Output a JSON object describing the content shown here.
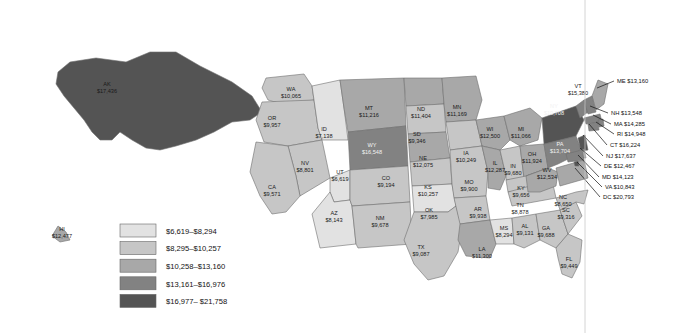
{
  "chart_data": {
    "type": "map",
    "title": "",
    "map_kind": "choropleth",
    "region": "United States",
    "value_prefix": "$",
    "legend": {
      "position": "bottom-left",
      "classes": [
        {
          "label": "$6,619–$8,294",
          "color": "#e2e2e2",
          "min": 6619,
          "max": 8294
        },
        {
          "label": "$8,295–$10,257",
          "color": "#c6c6c6",
          "min": 8295,
          "max": 10257
        },
        {
          "label": "$10,258–$13,160",
          "color": "#a8a8a8",
          "min": 10258,
          "max": 13160
        },
        {
          "label": "$13,161–$16,976",
          "color": "#828282",
          "min": 13161,
          "max": 16976
        },
        {
          "label": "$16,977– $21,758",
          "color": "#545454",
          "min": 16977,
          "max": 21758
        }
      ]
    },
    "states": [
      {
        "code": "AK",
        "value": "$17,436",
        "num": 17436,
        "class": 5,
        "label_mode": "inline"
      },
      {
        "code": "HI",
        "value": "$12,477",
        "num": 12477,
        "class": 3,
        "label_mode": "inline"
      },
      {
        "code": "WA",
        "value": "$10,065",
        "num": 10065,
        "class": 2,
        "label_mode": "inline"
      },
      {
        "code": "OR",
        "value": "$9,957",
        "num": 9957,
        "class": 2,
        "label_mode": "inline"
      },
      {
        "code": "ID",
        "value": "$7,138",
        "num": 7138,
        "class": 1,
        "label_mode": "inline"
      },
      {
        "code": "MT",
        "value": "$11,216",
        "num": 11216,
        "class": 3,
        "label_mode": "inline"
      },
      {
        "code": "WY",
        "value": "$16,548",
        "num": 16548,
        "class": 4,
        "label_mode": "inline"
      },
      {
        "code": "NV",
        "value": "$8,801",
        "num": 8801,
        "class": 2,
        "label_mode": "inline"
      },
      {
        "code": "UT",
        "value": "$6,619",
        "num": 6619,
        "class": 1,
        "label_mode": "inline"
      },
      {
        "code": "CA",
        "value": "$9,571",
        "num": 9571,
        "class": 2,
        "label_mode": "inline"
      },
      {
        "code": "AZ",
        "value": "$8,143",
        "num": 8143,
        "class": 1,
        "label_mode": "inline"
      },
      {
        "code": "CO",
        "value": "$9,194",
        "num": 9194,
        "class": 2,
        "label_mode": "inline"
      },
      {
        "code": "NM",
        "value": "$9,678",
        "num": 9678,
        "class": 2,
        "label_mode": "inline"
      },
      {
        "code": "ND",
        "value": "$11,404",
        "num": 11404,
        "class": 3,
        "label_mode": "inline"
      },
      {
        "code": "SD",
        "value": "$9,346",
        "num": 9346,
        "class": 2,
        "label_mode": "inline"
      },
      {
        "code": "NE",
        "value": "$12,075",
        "num": 12075,
        "class": 3,
        "label_mode": "inline"
      },
      {
        "code": "KS",
        "value": "$10,257",
        "num": 10257,
        "class": 2,
        "label_mode": "inline"
      },
      {
        "code": "OK",
        "value": "$7,985",
        "num": 7985,
        "class": 1,
        "label_mode": "inline"
      },
      {
        "code": "TX",
        "value": "$9,087",
        "num": 9087,
        "class": 2,
        "label_mode": "inline"
      },
      {
        "code": "MN",
        "value": "$11,169",
        "num": 11169,
        "class": 3,
        "label_mode": "inline"
      },
      {
        "code": "IA",
        "value": "$10,249",
        "num": 10249,
        "class": 2,
        "label_mode": "inline"
      },
      {
        "code": "MO",
        "value": "$9,900",
        "num": 9900,
        "class": 2,
        "label_mode": "inline"
      },
      {
        "code": "AR",
        "value": "$9,938",
        "num": 9938,
        "class": 2,
        "label_mode": "inline"
      },
      {
        "code": "LA",
        "value": "$11,300",
        "num": 11300,
        "class": 3,
        "label_mode": "inline"
      },
      {
        "code": "WI",
        "value": "$12,500",
        "num": 12500,
        "class": 3,
        "label_mode": "inline"
      },
      {
        "code": "IL",
        "value": "$12,287",
        "num": 12287,
        "class": 3,
        "label_mode": "inline"
      },
      {
        "code": "MS",
        "value": "$8,294",
        "num": 8294,
        "class": 1,
        "label_mode": "inline"
      },
      {
        "code": "MI",
        "value": "$11,066",
        "num": 11066,
        "class": 3,
        "label_mode": "inline"
      },
      {
        "code": "IN",
        "value": "$9,680",
        "num": 9680,
        "class": 2,
        "label_mode": "inline"
      },
      {
        "code": "OH",
        "value": "$11,924",
        "num": 11924,
        "class": 3,
        "label_mode": "inline"
      },
      {
        "code": "KY",
        "value": "$9,656",
        "num": 9656,
        "class": 2,
        "label_mode": "inline"
      },
      {
        "code": "TN",
        "value": "$8,878",
        "num": 8878,
        "class": 2,
        "label_mode": "inline"
      },
      {
        "code": "AL",
        "value": "$9,131",
        "num": 9131,
        "class": 2,
        "label_mode": "inline"
      },
      {
        "code": "GA",
        "value": "$9,688",
        "num": 9688,
        "class": 2,
        "label_mode": "inline"
      },
      {
        "code": "FL",
        "value": "$9,449",
        "num": 9449,
        "class": 2,
        "label_mode": "inline"
      },
      {
        "code": "SC",
        "value": "$9,316",
        "num": 9316,
        "class": 2,
        "label_mode": "inline"
      },
      {
        "code": "NC",
        "value": "$8,650",
        "num": 8650,
        "class": 2,
        "label_mode": "inline"
      },
      {
        "code": "WV",
        "value": "$12,534",
        "num": 12534,
        "class": 3,
        "label_mode": "inline"
      },
      {
        "code": "PA",
        "value": "$13,704",
        "num": 13704,
        "class": 4,
        "label_mode": "inline"
      },
      {
        "code": "NY",
        "value": "$19,708",
        "num": 19708,
        "class": 5,
        "label_mode": "inline"
      },
      {
        "code": "VT",
        "value": "$15,380",
        "num": 15380,
        "class": 4,
        "label_mode": "inline"
      },
      {
        "code": "ME",
        "value": "$13,160",
        "num": 13160,
        "class": 3,
        "label_mode": "callout"
      },
      {
        "code": "NH",
        "value": "$13,548",
        "num": 13548,
        "class": 4,
        "label_mode": "callout"
      },
      {
        "code": "MA",
        "value": "$14,285",
        "num": 14285,
        "class": 4,
        "label_mode": "callout"
      },
      {
        "code": "RI",
        "value": "$14,948",
        "num": 14948,
        "class": 4,
        "label_mode": "callout"
      },
      {
        "code": "CT",
        "value": "$16,224",
        "num": 16224,
        "class": 4,
        "label_mode": "callout"
      },
      {
        "code": "NJ",
        "value": "$17,637",
        "num": 17637,
        "class": 5,
        "label_mode": "callout"
      },
      {
        "code": "DE",
        "value": "$12,467",
        "num": 12467,
        "class": 3,
        "label_mode": "callout"
      },
      {
        "code": "MD",
        "value": "$14,123",
        "num": 14123,
        "class": 4,
        "label_mode": "callout"
      },
      {
        "code": "VA",
        "value": "$10,843",
        "num": 10843,
        "class": 3,
        "label_mode": "callout"
      },
      {
        "code": "DC",
        "value": "$20,793",
        "num": 20793,
        "class": 5,
        "label_mode": "callout"
      }
    ]
  },
  "map": {
    "inline_labels": [
      {
        "code": "AK",
        "value": "$17,436",
        "x": 107,
        "y": 86,
        "dark": false
      },
      {
        "code": "HI",
        "value": "$12,477",
        "x": 62,
        "y": 231,
        "dark": false
      },
      {
        "code": "WA",
        "value": "$10,065",
        "x": 291,
        "y": 91,
        "dark": false
      },
      {
        "code": "OR",
        "value": "$9,957",
        "x": 272,
        "y": 120,
        "dark": false
      },
      {
        "code": "ID",
        "value": "$7,138",
        "x": 324,
        "y": 131,
        "dark": false
      },
      {
        "code": "MT",
        "value": "$11,216",
        "x": 369,
        "y": 110,
        "dark": false
      },
      {
        "code": "WY",
        "value": "$16,548",
        "x": 372,
        "y": 147,
        "dark": true
      },
      {
        "code": "NV",
        "value": "$8,801",
        "x": 305,
        "y": 165,
        "dark": false
      },
      {
        "code": "UT",
        "value": "$6,619",
        "x": 340,
        "y": 174,
        "dark": false
      },
      {
        "code": "CA",
        "value": "$9,571",
        "x": 272,
        "y": 189,
        "dark": false
      },
      {
        "code": "AZ",
        "value": "$8,143",
        "x": 334,
        "y": 215,
        "dark": false
      },
      {
        "code": "CO",
        "value": "$9,194",
        "x": 386,
        "y": 180,
        "dark": false
      },
      {
        "code": "NM",
        "value": "$9,678",
        "x": 380,
        "y": 220,
        "dark": false
      },
      {
        "code": "ND",
        "value": "$11,404",
        "x": 421,
        "y": 111,
        "dark": false
      },
      {
        "code": "SD",
        "value": "$9,346",
        "x": 417,
        "y": 136,
        "dark": false
      },
      {
        "code": "NE",
        "value": "$12,075",
        "x": 423,
        "y": 160,
        "dark": false
      },
      {
        "code": "KS",
        "value": "$10,257",
        "x": 428,
        "y": 189,
        "dark": false
      },
      {
        "code": "OK",
        "value": "$7,985",
        "x": 429,
        "y": 212,
        "dark": false
      },
      {
        "code": "TX",
        "value": "$9,087",
        "x": 421,
        "y": 249,
        "dark": false
      },
      {
        "code": "MN",
        "value": "$11,169",
        "x": 457,
        "y": 109,
        "dark": false
      },
      {
        "code": "IA",
        "value": "$10,249",
        "x": 466,
        "y": 155,
        "dark": false
      },
      {
        "code": "MO",
        "value": "$9,900",
        "x": 469,
        "y": 184,
        "dark": false
      },
      {
        "code": "AR",
        "value": "$9,938",
        "x": 478,
        "y": 211,
        "dark": false
      },
      {
        "code": "LA",
        "value": "$11,300",
        "x": 482,
        "y": 251,
        "dark": false
      },
      {
        "code": "WI",
        "value": "$12,500",
        "x": 490,
        "y": 131,
        "dark": false
      },
      {
        "code": "IL",
        "value": "$12,287",
        "x": 495,
        "y": 165,
        "dark": false
      },
      {
        "code": "MS",
        "value": "$8,294",
        "x": 504,
        "y": 230,
        "dark": false
      },
      {
        "code": "MI",
        "value": "$11,066",
        "x": 521,
        "y": 131,
        "dark": false
      },
      {
        "code": "IN",
        "value": "$9,680",
        "x": 513,
        "y": 168,
        "dark": false
      },
      {
        "code": "OH",
        "value": "$11,924",
        "x": 532,
        "y": 156,
        "dark": false
      },
      {
        "code": "KY",
        "value": "$9,656",
        "x": 521,
        "y": 190,
        "dark": false
      },
      {
        "code": "TN",
        "value": "$8,878",
        "x": 520,
        "y": 207,
        "dark": false
      },
      {
        "code": "AL",
        "value": "$9,131",
        "x": 525,
        "y": 228,
        "dark": false
      },
      {
        "code": "GA",
        "value": "$9,688",
        "x": 546,
        "y": 230,
        "dark": false
      },
      {
        "code": "FL",
        "value": "$9,449",
        "x": 569,
        "y": 261,
        "dark": false
      },
      {
        "code": "SC",
        "value": "$9,316",
        "x": 566,
        "y": 212,
        "dark": false
      },
      {
        "code": "NC",
        "value": "$8,650",
        "x": 563,
        "y": 199,
        "dark": false
      },
      {
        "code": "WV",
        "value": "$12,534",
        "x": 547,
        "y": 172,
        "dark": false
      },
      {
        "code": "PA",
        "value": "$13,704",
        "x": 560,
        "y": 146,
        "dark": true
      },
      {
        "code": "NY",
        "value": "$19,708",
        "x": 554,
        "y": 108,
        "dark": true
      },
      {
        "code": "VT",
        "value": "$15,380",
        "x": 578,
        "y": 88,
        "dark": false
      }
    ],
    "callouts": [
      {
        "code": "ME",
        "value": "$13,160",
        "tx": 617,
        "ty": 83,
        "lx1": 614,
        "ly1": 81,
        "lx2": 597,
        "ly2": 88
      },
      {
        "code": "NH",
        "value": "$13,548",
        "tx": 611,
        "ty": 115,
        "lx1": 608,
        "ly1": 113,
        "lx2": 590,
        "ly2": 106
      },
      {
        "code": "MA",
        "value": "$14,285",
        "tx": 614,
        "ty": 126,
        "lx1": 611,
        "ly1": 124,
        "lx2": 593,
        "ly2": 115
      },
      {
        "code": "RI",
        "value": "$14,948",
        "tx": 617,
        "ty": 136,
        "lx1": 614,
        "ly1": 134,
        "lx2": 596,
        "ly2": 122
      },
      {
        "code": "CT",
        "value": "$16,224",
        "tx": 610,
        "ty": 147,
        "lx1": 607,
        "ly1": 145,
        "lx2": 589,
        "ly2": 124
      },
      {
        "code": "NJ",
        "value": "$17,637",
        "tx": 606,
        "ty": 158,
        "lx1": 603,
        "ly1": 156,
        "lx2": 583,
        "ly2": 135
      },
      {
        "code": "DE",
        "value": "$12,467",
        "tx": 604,
        "ty": 168,
        "lx1": 601,
        "ly1": 166,
        "lx2": 580,
        "ly2": 148
      },
      {
        "code": "MD",
        "value": "$14,123",
        "tx": 602,
        "ty": 179,
        "lx1": 599,
        "ly1": 177,
        "lx2": 578,
        "ly2": 155
      },
      {
        "code": "VA",
        "value": "$10,843",
        "tx": 605,
        "ty": 189,
        "lx1": 602,
        "ly1": 187,
        "lx2": 577,
        "ly2": 162
      },
      {
        "code": "DC",
        "value": "$20,793",
        "tx": 603,
        "ty": 199,
        "lx1": 600,
        "ly1": 197,
        "lx2": 575,
        "ly2": 168
      }
    ]
  },
  "legend": {
    "items": [
      {
        "label": "$6,619–$8,294",
        "color": "#e2e2e2"
      },
      {
        "label": "$8,295–$10,257",
        "color": "#c6c6c6"
      },
      {
        "label": "$10,258–$13,160",
        "color": "#a8a8a8"
      },
      {
        "label": "$13,161–$16,976",
        "color": "#828282"
      },
      {
        "label": "$16,977– $21,758",
        "color": "#545454"
      }
    ]
  }
}
